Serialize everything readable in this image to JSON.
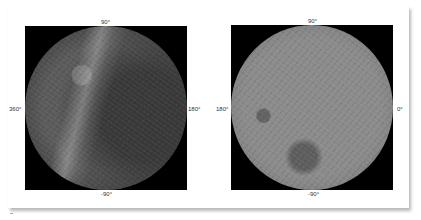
{
  "figure": {
    "maps": [
      {
        "name": "left-hemisphere",
        "labels": {
          "top": "90°",
          "bottom": "-90°",
          "left": "360°",
          "right": "180°"
        }
      },
      {
        "name": "right-hemisphere",
        "labels": {
          "top": "90°",
          "bottom": "-90°",
          "left": "180°",
          "right": "0°"
        }
      }
    ]
  }
}
